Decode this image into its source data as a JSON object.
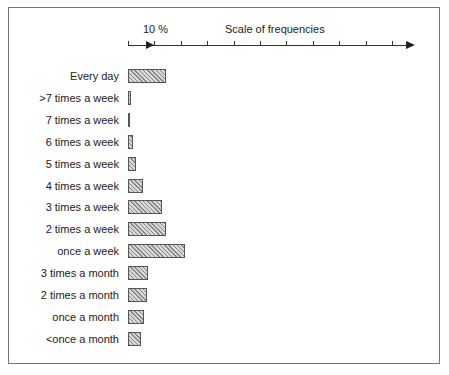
{
  "chart_data": {
    "type": "bar",
    "orientation": "horizontal",
    "title": "Scale of frequencies",
    "scale_label": "10 %",
    "xlabel": "Scale of frequencies",
    "ylabel": "",
    "xunit": "%",
    "xlim": [
      0,
      108
    ],
    "tick_interval": 10,
    "grid": false,
    "legend": null,
    "categories": [
      "Every day",
      ">7 times a week",
      "7 times a week",
      "6 times a week",
      "5 times a week",
      "4 times a week",
      "3 times a week",
      "2 times a week",
      "once a week",
      "3 times a month",
      "2 times a month",
      "once a month",
      "<once a month"
    ],
    "values": [
      14.5,
      1,
      0.8,
      2,
      3,
      5.7,
      13,
      14.5,
      21.5,
      7.5,
      7.2,
      6,
      5
    ]
  }
}
